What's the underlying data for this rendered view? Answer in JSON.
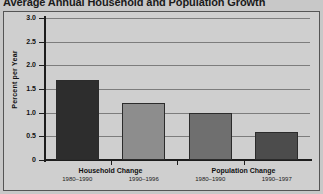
{
  "chart_data": {
    "type": "bar",
    "title": "Average Annual Household and Population Growth",
    "xlabel": "",
    "ylabel": "Percent per Year",
    "ylim": [
      0,
      3.0
    ],
    "yticks": [
      "0",
      "0.5",
      "1.0",
      "1.5",
      "2.0",
      "2.5",
      "3.0"
    ],
    "ytick_values": [
      0,
      0.5,
      1.0,
      1.5,
      2.0,
      2.5,
      3.0
    ],
    "grid": true,
    "legend": "none",
    "categories": [
      "1980–1990",
      "1990–1996",
      "1980–1990",
      "1990–1997"
    ],
    "values": [
      1.7,
      1.2,
      1.0,
      0.6
    ],
    "bar_colors": [
      "#2d2d2d",
      "#8d8d8d",
      "#6f6f6f",
      "#4c4c4c"
    ],
    "groups": [
      {
        "label": "Household Change",
        "bars": [
          {
            "period": "1980–1990",
            "value": 1.7,
            "color": "#2d2d2d"
          },
          {
            "period": "1990–1996",
            "value": 1.2,
            "color": "#8d8d8d"
          }
        ]
      },
      {
        "label": "Population Change",
        "bars": [
          {
            "period": "1980–1990",
            "value": 1.0,
            "color": "#6f6f6f"
          },
          {
            "period": "1990–1997",
            "value": 0.6,
            "color": "#4c4c4c"
          }
        ]
      }
    ]
  },
  "figure": {
    "background": "#c8c8c8",
    "plot_background": "#cfcfcf",
    "grid_color": "#7d7d7d",
    "axis_color": "#1d1d1d"
  }
}
